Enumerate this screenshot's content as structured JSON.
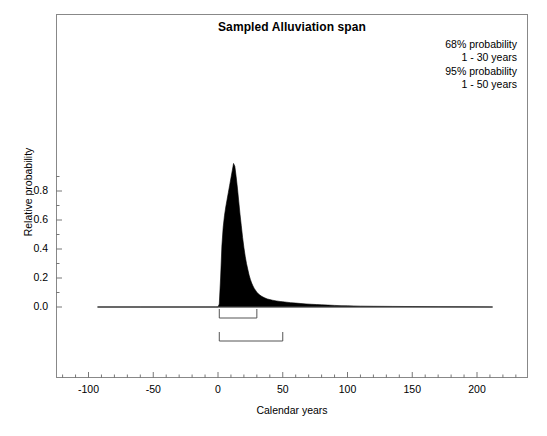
{
  "chart_data": {
    "type": "area",
    "title": "Sampled Alluviation span",
    "xlabel": "Calendar years",
    "ylabel": "Relative probability",
    "xlim": [
      -125,
      240
    ],
    "ylim": [
      -0.06,
      1.1
    ],
    "grid": false,
    "legend_position": "none",
    "x_ticks": [
      -100,
      -50,
      0,
      50,
      100,
      150,
      200
    ],
    "x_tick_labels": [
      "-100",
      "-50",
      "0",
      "50",
      "100",
      "150",
      "200"
    ],
    "x_minor_tick_interval": 10,
    "y_ticks": [
      0.0,
      0.2,
      0.4,
      0.6,
      0.8
    ],
    "y_tick_labels": [
      "0.0",
      "0.2",
      "0.4",
      "0.6",
      "0.8"
    ],
    "y_minor_tick_interval": 0.1,
    "series": [
      {
        "name": "Sampled alluviation span probability distribution",
        "fill_color": "#000000",
        "x": [
          -93,
          -60,
          -30,
          -10,
          -2,
          0,
          1,
          2,
          3,
          4,
          5,
          6,
          7,
          8,
          9,
          10,
          11,
          12,
          13,
          14,
          15,
          16,
          17,
          18,
          19,
          20,
          21,
          22,
          23,
          24,
          25,
          26,
          27,
          28,
          30,
          32,
          34,
          36,
          38,
          40,
          42,
          45,
          48,
          50,
          53,
          56,
          60,
          64,
          68,
          72,
          76,
          80,
          85,
          90,
          95,
          100,
          110,
          120,
          135,
          150,
          170,
          190,
          212
        ],
        "y": [
          0.0,
          0.0,
          0.0,
          0.0,
          0.0,
          0.0,
          0.02,
          0.2,
          0.42,
          0.55,
          0.63,
          0.69,
          0.74,
          0.79,
          0.84,
          0.89,
          0.94,
          0.99,
          0.97,
          0.9,
          0.82,
          0.73,
          0.64,
          0.56,
          0.48,
          0.41,
          0.35,
          0.3,
          0.26,
          0.22,
          0.19,
          0.165,
          0.145,
          0.128,
          0.102,
          0.084,
          0.072,
          0.063,
          0.056,
          0.051,
          0.047,
          0.042,
          0.038,
          0.036,
          0.033,
          0.03,
          0.027,
          0.024,
          0.021,
          0.019,
          0.017,
          0.015,
          0.013,
          0.011,
          0.009,
          0.008,
          0.006,
          0.005,
          0.004,
          0.003,
          0.002,
          0.001,
          0.0
        ]
      }
    ],
    "ranges": [
      {
        "name": "68% probability range",
        "level": "68%",
        "start": 1,
        "end": 30,
        "row": 0
      },
      {
        "name": "95% probability range",
        "level": "95%",
        "start": 1,
        "end": 50,
        "row": 1
      }
    ]
  },
  "annotation": {
    "line1": "68% probability",
    "line2": "1 - 30 years",
    "line3": "95% probability",
    "line4": "1 - 50 years"
  }
}
